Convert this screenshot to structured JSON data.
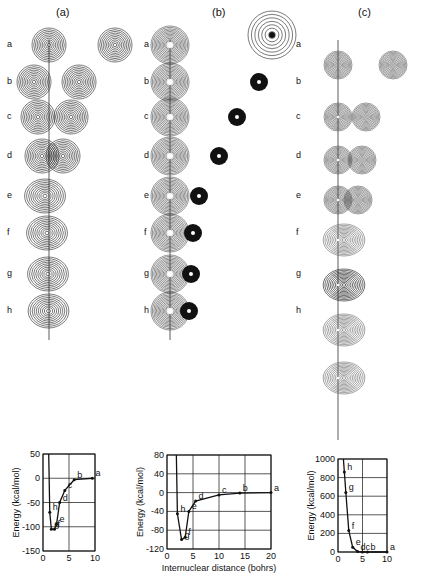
{
  "panels": [
    {
      "id": "a",
      "label": "(a)"
    },
    {
      "id": "b",
      "label": "(b)"
    },
    {
      "id": "c",
      "label": "(c)"
    }
  ],
  "row_labels": [
    "a",
    "b",
    "c",
    "d",
    "e",
    "f",
    "g",
    "h"
  ],
  "chart_data": [
    {
      "type": "line",
      "panel": "(a)",
      "title": "",
      "xlabel": "",
      "ylabel": "Energy (kcal/mol)",
      "xlim": [
        0,
        10
      ],
      "ylim": [
        -150,
        50
      ],
      "xticks": [
        0,
        5,
        10
      ],
      "yticks": [
        50,
        0,
        -50,
        -100,
        -150
      ],
      "grid": true,
      "points": [
        {
          "label": "a",
          "x": 9.5,
          "y": 0
        },
        {
          "label": "b",
          "x": 6,
          "y": -3
        },
        {
          "label": "c",
          "x": 4.2,
          "y": -25
        },
        {
          "label": "d",
          "x": 3.2,
          "y": -50
        },
        {
          "label": "e",
          "x": 2.6,
          "y": -95
        },
        {
          "label": "f",
          "x": 2.2,
          "y": -105
        },
        {
          "label": "g",
          "x": 1.6,
          "y": -105
        },
        {
          "label": "h",
          "x": 1.3,
          "y": -70
        }
      ]
    },
    {
      "type": "line",
      "panel": "(b)",
      "title": "",
      "xlabel": "Internuclear distance (bohrs)",
      "ylabel": "Energy (kcal/mol)",
      "xlim": [
        0,
        20
      ],
      "ylim": [
        -120,
        80
      ],
      "xticks": [
        0,
        5,
        10,
        15,
        20
      ],
      "yticks": [
        80,
        40,
        0,
        -40,
        -80,
        -120
      ],
      "grid": true,
      "points": [
        {
          "label": "a",
          "x": 20,
          "y": 0
        },
        {
          "label": "b",
          "x": 14,
          "y": -1
        },
        {
          "label": "c",
          "x": 10,
          "y": -5
        },
        {
          "label": "d",
          "x": 5.5,
          "y": -18
        },
        {
          "label": "e",
          "x": 4.2,
          "y": -40
        },
        {
          "label": "f",
          "x": 3.5,
          "y": -95
        },
        {
          "label": "g",
          "x": 2.8,
          "y": -100
        },
        {
          "label": "h",
          "x": 2.0,
          "y": -45
        }
      ]
    },
    {
      "type": "line",
      "panel": "(c)",
      "title": "",
      "xlabel": "",
      "ylabel": "Energy (kcal/mol)",
      "xlim": [
        0,
        10
      ],
      "ylim": [
        0,
        1000
      ],
      "xticks": [
        0,
        5,
        10
      ],
      "yticks": [
        1000,
        800,
        600,
        400,
        200,
        0
      ],
      "grid": true,
      "points": [
        {
          "label": "a",
          "x": 10,
          "y": 0
        },
        {
          "label": "b",
          "x": 6,
          "y": 0
        },
        {
          "label": "c",
          "x": 5,
          "y": 0
        },
        {
          "label": "d",
          "x": 4,
          "y": 5
        },
        {
          "label": "e",
          "x": 3,
          "y": 50
        },
        {
          "label": "f",
          "x": 2.2,
          "y": 230
        },
        {
          "label": "g",
          "x": 1.6,
          "y": 640
        },
        {
          "label": "h",
          "x": 1.3,
          "y": 860
        }
      ]
    }
  ],
  "labels": {
    "ylabel": "Energy (kcal/mol)",
    "xlabel_b": "Internuclear distance (bohrs)"
  }
}
